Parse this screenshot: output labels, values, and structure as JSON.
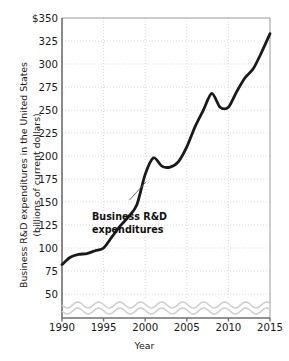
{
  "chart_data": {
    "type": "line",
    "title": "",
    "xlabel": "Year",
    "ylabel": "Business R&D expenditures in the United States (billions of current dollars)",
    "ylabel_line1": "Business R&D expenditures in the United States",
    "ylabel_line2": "(billions of current dollars)",
    "grid": true,
    "legend_position": "none",
    "y_axis_broken": true,
    "y_break_note": "wavy axis-break symbol below 50",
    "xlim": [
      1990,
      2015
    ],
    "ylim": [
      50,
      350
    ],
    "ytick_labels": [
      "$350",
      "325",
      "300",
      "275",
      "250",
      "225",
      "200",
      "175",
      "150",
      "125",
      "100",
      "75",
      "50"
    ],
    "ytick_values": [
      350,
      325,
      300,
      275,
      250,
      225,
      200,
      175,
      150,
      125,
      100,
      75,
      50
    ],
    "xtick_labels": [
      "1990",
      "1995",
      "2000",
      "2005",
      "2010",
      "2015"
    ],
    "xtick_values": [
      1990,
      1995,
      2000,
      2005,
      2010,
      2015
    ],
    "series": [
      {
        "name": "Business R&D expenditures",
        "color": "#1a1a1a",
        "x": [
          1990,
          1991,
          1992,
          1993,
          1994,
          1995,
          1996,
          1997,
          1998,
          1999,
          2000,
          2001,
          2002,
          2003,
          2004,
          2005,
          2006,
          2007,
          2008,
          2009,
          2010,
          2011,
          2012,
          2013,
          2014,
          2015
        ],
        "values": [
          82,
          90,
          93,
          94,
          97,
          100,
          112,
          124,
          134,
          147,
          180,
          198,
          189,
          188,
          194,
          210,
          232,
          250,
          268,
          253,
          253,
          270,
          285,
          295,
          313,
          333
        ]
      }
    ],
    "annotations": [
      {
        "text_line1": "Business R&D",
        "text_line2": "expenditures",
        "label_x": 1993.6,
        "label_y": 143,
        "leader_from_x": 1998.1,
        "leader_from_y": 152,
        "leader_to_x": 2000.1,
        "leader_to_y": 172
      }
    ],
    "colors": {
      "line": "#1a1a1a",
      "grid": "#d8d8d8",
      "axis": "#6e6e6e",
      "text": "#1a1a1a",
      "break_symbol": "#d0d0d0",
      "background": "#ffffff"
    }
  }
}
